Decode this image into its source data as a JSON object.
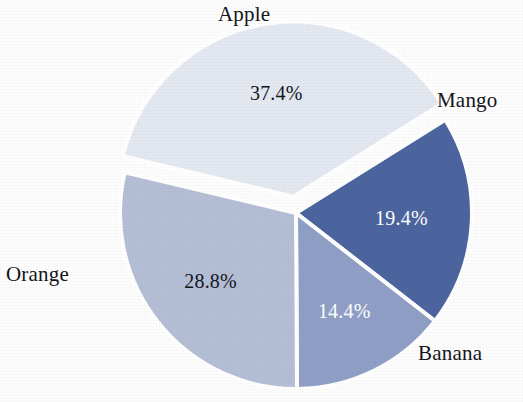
{
  "chart_data": {
    "type": "pie",
    "title": "",
    "subtitle": "",
    "xlabel": "",
    "ylabel": "",
    "grid": false,
    "legend_position": "none",
    "labels_position": "outside-callout",
    "categories": [
      "Apple",
      "Mango",
      "Banana",
      "Orange"
    ],
    "values": [
      19.4,
      14.4,
      28.8,
      37.4
    ],
    "value_unit": "%",
    "data_labels": [
      "19.4%",
      "14.4%",
      "28.8%",
      "37.4%"
    ],
    "start_angle_deg": -32,
    "direction": "clockwise",
    "exploded_slices": [
      "Orange"
    ],
    "slices": [
      {
        "name": "Apple",
        "value": 19.4,
        "data_label": "19.4%",
        "color": "#4d659f",
        "label_text_color": "#ffffff",
        "exploded": false
      },
      {
        "name": "Mango",
        "value": 14.4,
        "data_label": "14.4%",
        "color": "#8f9fc6",
        "label_text_color": "#ffffff",
        "exploded": false
      },
      {
        "name": "Banana",
        "value": 28.8,
        "data_label": "28.8%",
        "color": "#b4bfd6",
        "label_text_color": "#14161c",
        "exploded": false
      },
      {
        "name": "Orange",
        "value": 37.4,
        "data_label": "37.4%",
        "color": "#e3e8f1",
        "label_text_color": "#14161c",
        "exploded": true
      }
    ]
  },
  "labels": {
    "apple": "Apple",
    "mango": "Mango",
    "banana": "Banana",
    "orange": "Orange"
  },
  "percentages": {
    "apple": "19.4%",
    "mango": "14.4%",
    "banana": "28.8%",
    "orange": "37.4%"
  },
  "colors": {
    "apple": "#4d659f",
    "mango": "#8f9fc6",
    "banana": "#b4bfd6",
    "orange": "#e3e8f1",
    "background": "#fdfdfd",
    "separator": "#ffffff",
    "text": "#14161c",
    "text_on_dark": "#ffffff"
  },
  "geometry": {
    "center_x": 296,
    "center_y": 213,
    "radius": 176,
    "explode_offset": 16
  }
}
